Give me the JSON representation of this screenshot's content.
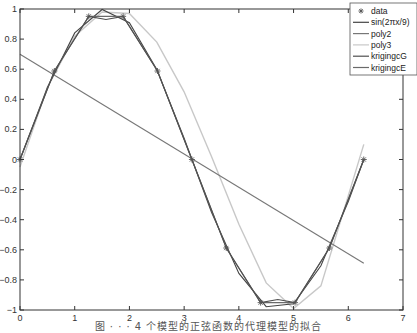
{
  "chart_data": {
    "type": "line",
    "title": "",
    "xlabel": "",
    "ylabel": "",
    "xlim": [
      0,
      7
    ],
    "ylim": [
      -1,
      1
    ],
    "xticks": [
      0,
      1,
      2,
      3,
      4,
      5,
      6,
      7
    ],
    "yticks": [
      -1,
      -0.8,
      -0.6,
      -0.4,
      -0.2,
      0,
      0.2,
      0.4,
      0.6,
      0.8,
      1
    ],
    "xtick_labels": [
      "0",
      "1",
      "2",
      "3",
      "4",
      "5",
      "6",
      "7"
    ],
    "ytick_labels": [
      "-1",
      "-0.8",
      "-0.6",
      "-0.4",
      "-0.2",
      "0",
      "0.2",
      "0.4",
      "0.6",
      "0.8",
      "1"
    ],
    "grid": false,
    "legend_position": "upper right",
    "series": [
      {
        "name": "data",
        "style": "markers-star",
        "color": "#555555",
        "x": [
          0,
          0.628,
          1.257,
          1.885,
          2.513,
          3.142,
          3.77,
          4.398,
          5.027,
          5.655,
          6.283
        ],
        "y": [
          0,
          0.588,
          0.951,
          0.951,
          0.588,
          0,
          -0.588,
          -0.951,
          -0.951,
          -0.588,
          0
        ]
      },
      {
        "name": "sin(2πx/9)",
        "style": "line",
        "color": "#444444",
        "x": [
          0,
          0.5,
          1.0,
          1.5,
          2.0,
          2.5,
          3.0,
          3.5,
          4.0,
          4.5,
          5.0,
          5.5,
          6.0,
          6.283
        ],
        "y": [
          0,
          0.479,
          0.841,
          0.997,
          0.909,
          0.598,
          0.141,
          -0.351,
          -0.757,
          -0.978,
          -0.959,
          -0.706,
          -0.279,
          0
        ]
      },
      {
        "name": "poly2",
        "style": "line",
        "color": "#777777",
        "x": [
          0,
          6.283
        ],
        "y": [
          0.7,
          -0.69
        ]
      },
      {
        "name": "poly3",
        "style": "line",
        "color": "#c8c8c8",
        "x": [
          0,
          0.5,
          1.0,
          1.5,
          2.0,
          2.5,
          3.0,
          3.5,
          4.0,
          4.5,
          5.0,
          5.5,
          6.0,
          6.283
        ],
        "y": [
          -0.05,
          0.48,
          0.82,
          0.98,
          0.97,
          0.78,
          0.45,
          0.02,
          -0.43,
          -0.82,
          -0.99,
          -0.84,
          -0.24,
          0.1
        ]
      },
      {
        "name": "krigingcG",
        "style": "line",
        "color": "#505050",
        "x": [
          0,
          0.628,
          1.257,
          1.571,
          1.885,
          2.513,
          3.142,
          3.77,
          4.398,
          4.712,
          5.027,
          5.655,
          6.283
        ],
        "y": [
          0,
          0.588,
          0.951,
          0.93,
          0.951,
          0.588,
          0,
          -0.588,
          -0.951,
          -0.93,
          -0.951,
          -0.588,
          0
        ]
      },
      {
        "name": "krigingcE",
        "style": "line",
        "color": "#6a6a6a",
        "x": [
          0,
          0.628,
          1.257,
          1.885,
          2.513,
          3.142,
          3.77,
          4.398,
          5.027,
          5.655,
          6.283
        ],
        "y": [
          0,
          0.588,
          0.951,
          0.951,
          0.588,
          0,
          -0.588,
          -0.951,
          -0.951,
          -0.588,
          0
        ]
      }
    ]
  },
  "legend": {
    "items": [
      "data",
      "sin(2πx/9)",
      "poly2",
      "poly3",
      "krigingcG",
      "krigingcE"
    ]
  },
  "caption": "图 · · · 4 个模型的正弦函数的代理模型的拟合"
}
